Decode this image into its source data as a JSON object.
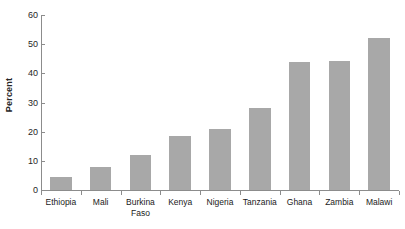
{
  "chart_data": {
    "type": "bar",
    "title": "",
    "subtitle": "",
    "xlabel": "",
    "ylabel": "Percent",
    "categories": [
      "Ethiopia",
      "Mali",
      "Burkina Faso",
      "Kenya",
      "Nigeria",
      "Tanzania",
      "Ghana",
      "Zambia",
      "Malawi"
    ],
    "values": [
      4.5,
      8,
      12,
      18.5,
      21,
      28,
      44,
      44.3,
      52
    ],
    "series": [
      {
        "name": "Percent",
        "values": [
          4.5,
          8,
          12,
          18.5,
          21,
          28,
          44,
          44.3,
          52
        ]
      }
    ],
    "ylim": [
      0,
      60
    ],
    "ytick_values": [
      0,
      10,
      20,
      30,
      40,
      50,
      60
    ],
    "ytick_labels": [
      "0",
      "10",
      "20",
      "30",
      "40",
      "50",
      "60"
    ],
    "grid": false,
    "legend": false,
    "legend_position": "none",
    "annotations": [],
    "bar_color": "#a8a8a8",
    "axis_color": "#8c8c8c",
    "text_color": "#1a1a1a",
    "background_color": "#ffffff"
  },
  "axis": {
    "y_title": "Percent"
  },
  "categories": [
    {
      "line1": "Ethiopia",
      "line2": ""
    },
    {
      "line1": "Mali",
      "line2": ""
    },
    {
      "line1": "Burkina",
      "line2": "Faso"
    },
    {
      "line1": "Kenya",
      "line2": ""
    },
    {
      "line1": "Nigeria",
      "line2": ""
    },
    {
      "line1": "Tanzania",
      "line2": ""
    },
    {
      "line1": "Ghana",
      "line2": ""
    },
    {
      "line1": "Zambia",
      "line2": ""
    },
    {
      "line1": "Malawi",
      "line2": ""
    }
  ]
}
